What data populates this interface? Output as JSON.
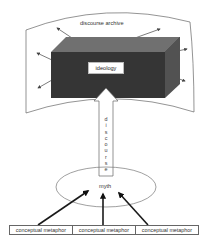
{
  "diagram": {
    "archive_label": "discourse archive",
    "ideology_label": "ideology",
    "discourse_letters": [
      "d",
      "i",
      "s",
      "c",
      "o",
      "u",
      "r",
      "s",
      "e"
    ],
    "myth_label": "myth",
    "metaphors": [
      "conceptual metaphor",
      "conceptual metaphor",
      "conceptual metaphor"
    ],
    "colors": {
      "box_front": "#3a3a3a",
      "box_top": "#6e6e6e",
      "box_side": "#545454",
      "lines": "#555555",
      "thick_arrows": "#1a1a1a"
    }
  }
}
